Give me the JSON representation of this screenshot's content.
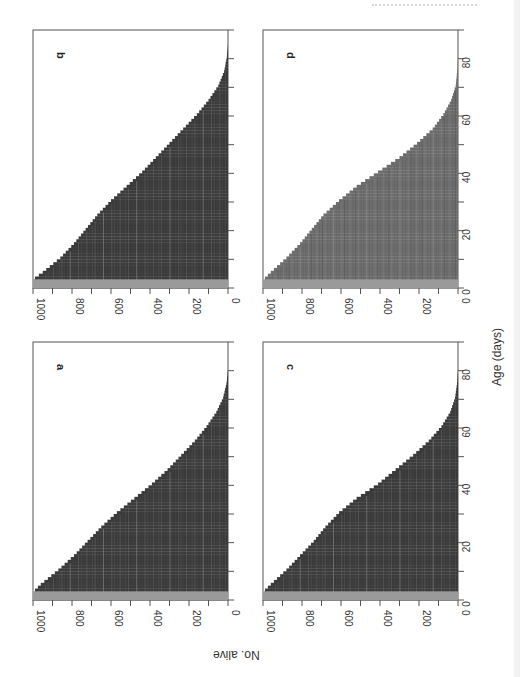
{
  "figure": {
    "orientation": "rotated 90 degrees on page",
    "x_axis_label": "Age (days)",
    "y_axis_label": "No. alive",
    "colors": {
      "frame": "#555555",
      "fill_dark": "#3a3a3a",
      "fill_mid": "#6d6d6d",
      "fill_light": "#8f8f8f",
      "base_band": "#9a9a9a"
    }
  },
  "chart_data": [
    {
      "type": "area",
      "panel": "a",
      "title": "a",
      "xlabel": "Age (days)",
      "ylabel": "No. alive",
      "xlim": [
        0,
        90
      ],
      "ylim": [
        0,
        1000
      ],
      "x_ticks": [
        0,
        20,
        40,
        60,
        80
      ],
      "y_ticks": [
        0,
        200,
        400,
        600,
        800,
        1000
      ],
      "x": [
        0,
        3,
        5,
        10,
        15,
        20,
        25,
        30,
        35,
        40,
        45,
        50,
        55,
        60,
        65,
        70,
        75,
        80
      ],
      "values": [
        1000,
        990,
        960,
        870,
        790,
        720,
        650,
        570,
        480,
        390,
        310,
        240,
        170,
        110,
        60,
        25,
        8,
        0
      ]
    },
    {
      "type": "area",
      "panel": "b",
      "title": "b",
      "xlabel": "Age (days)",
      "ylabel": "No. alive",
      "xlim": [
        0,
        90
      ],
      "ylim": [
        0,
        1000
      ],
      "x_ticks": [
        0,
        20,
        40,
        60,
        80
      ],
      "y_ticks": [
        0,
        200,
        400,
        600,
        800,
        1000
      ],
      "x": [
        0,
        3,
        5,
        10,
        15,
        20,
        25,
        30,
        35,
        40,
        45,
        50,
        55,
        60,
        65,
        70,
        75,
        80,
        85
      ],
      "values": [
        1000,
        990,
        950,
        860,
        790,
        730,
        670,
        600,
        520,
        440,
        370,
        300,
        230,
        160,
        100,
        50,
        20,
        6,
        0
      ]
    },
    {
      "type": "area",
      "panel": "c",
      "title": "c",
      "xlabel": "Age (days)",
      "ylabel": "No. alive",
      "xlim": [
        0,
        90
      ],
      "ylim": [
        0,
        1000
      ],
      "x_ticks": [
        0,
        20,
        40,
        60,
        80
      ],
      "y_ticks": [
        0,
        200,
        400,
        600,
        800,
        1000
      ],
      "x": [
        0,
        3,
        5,
        10,
        15,
        20,
        25,
        30,
        35,
        40,
        45,
        50,
        55,
        60,
        65,
        70,
        75,
        80
      ],
      "values": [
        1000,
        990,
        960,
        880,
        810,
        740,
        680,
        610,
        520,
        410,
        320,
        230,
        150,
        85,
        40,
        15,
        5,
        0
      ]
    },
    {
      "type": "area",
      "panel": "d",
      "title": "d",
      "xlabel": "Age (days)",
      "ylabel": "No. alive",
      "xlim": [
        0,
        90
      ],
      "ylim": [
        0,
        1000
      ],
      "x_ticks": [
        0,
        20,
        40,
        60,
        80
      ],
      "y_ticks": [
        0,
        200,
        400,
        600,
        800,
        1000
      ],
      "x": [
        0,
        3,
        5,
        10,
        15,
        20,
        25,
        30,
        35,
        40,
        45,
        50,
        55,
        60,
        65,
        70,
        75,
        80
      ],
      "values": [
        1000,
        990,
        960,
        880,
        810,
        750,
        690,
        610,
        520,
        410,
        300,
        210,
        130,
        75,
        35,
        12,
        4,
        0
      ]
    }
  ]
}
